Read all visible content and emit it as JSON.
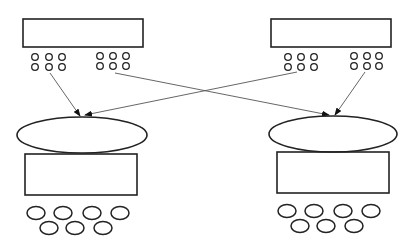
{
  "diagram": {
    "width": 419,
    "height": 249,
    "background": "#ffffff",
    "stroke_color": "#222222",
    "arrow_color": "#555555",
    "top_nodes": [
      {
        "id": "top-left",
        "rect": {
          "x": 23,
          "y": 19,
          "w": 120,
          "h": 28
        },
        "dot_groups": [
          {
            "cols": [
              35,
              49,
              62
            ],
            "rows": [
              57,
              67
            ],
            "r": 3.3
          },
          {
            "cols": [
              100,
              113,
              126
            ],
            "rows": [
              56,
              66
            ],
            "r": 3.3
          }
        ]
      },
      {
        "id": "top-right",
        "rect": {
          "x": 271,
          "y": 19,
          "w": 120,
          "h": 28
        },
        "dot_groups": [
          {
            "cols": [
              288,
              301,
              314
            ],
            "rows": [
              57,
              67
            ],
            "r": 3.3
          },
          {
            "cols": [
              354,
              367,
              379
            ],
            "rows": [
              56,
              66
            ],
            "r": 3.3
          }
        ]
      }
    ],
    "bottom_nodes": [
      {
        "id": "bottom-left",
        "ellipse": {
          "cx": 82,
          "cy": 135,
          "rx": 65,
          "ry": 18
        },
        "rect": {
          "x": 25,
          "y": 154,
          "w": 112,
          "h": 41
        },
        "circles_row1": {
          "xs": [
            36,
            63,
            92,
            120
          ],
          "y": 213
        },
        "circles_row2": {
          "xs": [
            49,
            75,
            103
          ],
          "y": 228
        },
        "circle_rx": 9,
        "circle_ry": 6.5
      },
      {
        "id": "bottom-right",
        "ellipse": {
          "cx": 333,
          "cy": 134,
          "rx": 64,
          "ry": 18
        },
        "rect": {
          "x": 277,
          "y": 152,
          "w": 112,
          "h": 41
        },
        "circles_row1": {
          "xs": [
            287,
            314,
            343,
            371
          ],
          "y": 211
        },
        "circles_row2": {
          "xs": [
            300,
            326,
            354
          ],
          "y": 226
        },
        "circle_rx": 9,
        "circle_ry": 6.5
      }
    ],
    "arrows": [
      {
        "from": [
          50,
          73
        ],
        "to": [
          80,
          116
        ]
      },
      {
        "from": [
          115,
          73
        ],
        "to": [
          329,
          115
        ]
      },
      {
        "from": [
          297,
          72
        ],
        "to": [
          85,
          115
        ]
      },
      {
        "from": [
          365,
          72
        ],
        "to": [
          335,
          115
        ]
      }
    ]
  }
}
